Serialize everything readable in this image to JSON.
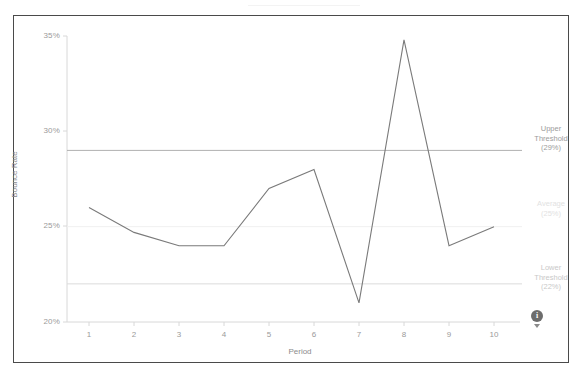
{
  "chart_data": {
    "type": "line",
    "title": "",
    "xlabel": "Period",
    "ylabel": "Bounce Rate",
    "x": [
      1,
      2,
      3,
      4,
      5,
      6,
      7,
      8,
      9,
      10
    ],
    "xticklabels": [
      "1",
      "2",
      "3",
      "4",
      "5",
      "6",
      "7",
      "8",
      "9",
      "10"
    ],
    "yticklabels": [
      "35%",
      "30%",
      "25%",
      "20%"
    ],
    "ytickvalues": [
      35,
      30,
      25,
      20
    ],
    "ylim": [
      20,
      35
    ],
    "xlim": [
      0.5,
      10.5
    ],
    "grid": false,
    "legend": "none",
    "series": [
      {
        "name": "Bounce Rate",
        "color": "#7a7a7a",
        "values": [
          26.0,
          24.7,
          24.0,
          24.0,
          27.0,
          28.0,
          21.0,
          34.8,
          24.0,
          25.0
        ]
      }
    ],
    "reference_lines": [
      {
        "id": "upper-threshold",
        "label": "Upper Threshold (29%)",
        "label_lines": [
          "Upper",
          "Threshold",
          "(29%)"
        ],
        "value": 29.0,
        "color": "#b0b0b0",
        "text_color": "#9c9c9c"
      },
      {
        "id": "average",
        "label": "Average (25%)",
        "label_lines": [
          "Average",
          "(25%)"
        ],
        "value": 25.0,
        "color": "#f0f0f0",
        "text_color": "#e2e2e2"
      },
      {
        "id": "lower-threshold",
        "label": "Lower Threshold (22%)",
        "label_lines": [
          "Lower",
          "Threshold",
          "(22%)"
        ],
        "value": 22.0,
        "color": "#dcdcdc",
        "text_color": "#c9c9c9"
      }
    ]
  },
  "axis": {
    "y_title": "Bounce Rate",
    "x_title": "Period",
    "y_ticks": [
      "35%",
      "30%",
      "25%",
      "20%"
    ],
    "x_ticks": [
      "1",
      "2",
      "3",
      "4",
      "5",
      "6",
      "7",
      "8",
      "9",
      "10"
    ]
  },
  "annotations": {
    "upper": {
      "line1": "Upper",
      "line2": "Threshold",
      "line3": "(29%)"
    },
    "average": {
      "line1": "Average",
      "line2": "(25%)",
      "line3": ""
    },
    "lower": {
      "line1": "Lower",
      "line2": "Threshold",
      "line3": "(22%)"
    }
  },
  "badge": {
    "symbol": "i"
  },
  "colors": {
    "series": "#7a7a7a",
    "frame": "#4a4a4a",
    "axis": "#d8d8d8",
    "tick_text": "#9a9a9a"
  }
}
